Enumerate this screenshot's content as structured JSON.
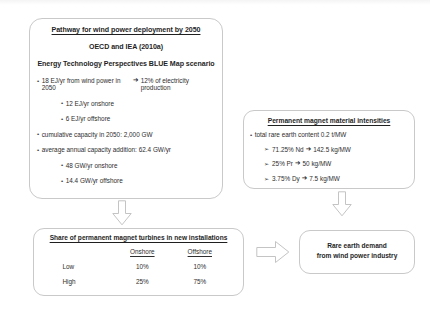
{
  "diagram": {
    "line_color": "#c9c9c9",
    "text_color": "#2b2b2b"
  },
  "main_box": {
    "title": "Pathway for wind power deployment by 2050",
    "subtitle_1": "OECD and IEA (2010a)",
    "subtitle_2": "Energy Technology Perspectives BLUE Map scenario",
    "bullets": [
      {
        "level": 1,
        "marker": "•",
        "text_before_arrow": "18 EJ/yr from wind power in 2050",
        "arrow": "➔",
        "text_after_arrow": "12% of electricity production"
      },
      {
        "level": 2,
        "marker": "•",
        "text": "12 EJ/yr onshore"
      },
      {
        "level": 2,
        "marker": "•",
        "text": "6 EJ/yr offshore"
      },
      {
        "level": 1,
        "marker": "•",
        "text": "cumulative capacity in 2050: 2,000 GW"
      },
      {
        "level": 1,
        "marker": "•",
        "text": "average annual capacity addition: 62.4 GW/yr"
      },
      {
        "level": 2,
        "marker": "•",
        "text": "48 GW/yr onshore"
      },
      {
        "level": 2,
        "marker": "•",
        "text": "14.4 GW/yr offshore"
      }
    ]
  },
  "pm_box": {
    "title": "Permanent magnet material intensities",
    "bullets": [
      {
        "level": 1,
        "marker": "•",
        "text": "total rare earth content 0.2 t/MW"
      },
      {
        "level": 2,
        "marker": "➢",
        "text_before_arrow": "71.25% Nd",
        "arrow": "➔",
        "text_after_arrow": "142.5 kg/MW"
      },
      {
        "level": 2,
        "marker": "➢",
        "text_before_arrow": "25% Pr",
        "arrow": "➔",
        "text_after_arrow": "50 kg/MW"
      },
      {
        "level": 2,
        "marker": "➢",
        "text_before_arrow": "3.75% Dy",
        "arrow": "➔",
        "text_after_arrow": "7.5 kg/MW"
      }
    ]
  },
  "share_box": {
    "title": "Share of permanent magnet turbines in new installations",
    "columns": [
      "",
      "Onshore",
      "Offshore"
    ],
    "rows": [
      {
        "label": "Low",
        "onshore": "10%",
        "offshore": "10%"
      },
      {
        "label": "High",
        "onshore": "25%",
        "offshore": "75%"
      }
    ]
  },
  "demand_box": {
    "line_1": "Rare earth demand",
    "line_2": "from wind power industry"
  },
  "arrows": [
    {
      "name": "arrow-down-from-main-box",
      "direction": "down"
    },
    {
      "name": "arrow-down-from-pm-box",
      "direction": "down"
    },
    {
      "name": "arrow-right-from-share-box",
      "direction": "right"
    }
  ]
}
